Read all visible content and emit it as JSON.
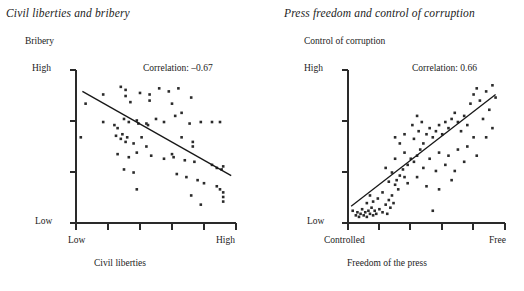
{
  "figure": {
    "background_color": "#ffffff",
    "point_color": "#2b2b2b",
    "line_color": "#171717"
  },
  "panels": [
    {
      "title": "Civil liberties and bribery",
      "y_axis_title": "Bribery",
      "x_axis_title": "Civil liberties",
      "y_tick_high": "High",
      "y_tick_low": "Low",
      "x_tick_left": "Low",
      "x_tick_right": "High",
      "correlation_label": "Correlation: –0.67"
    },
    {
      "title": "Press freedom and control of corruption",
      "y_axis_title": "Control of corruption",
      "x_axis_title": "Freedom of the press",
      "y_tick_high": "High",
      "y_tick_low": "Low",
      "x_tick_left": "Controlled",
      "x_tick_right": "Free",
      "correlation_label": "Correlation: 0.66"
    }
  ],
  "chart_data": [
    {
      "type": "scatter",
      "title": "Civil liberties and bribery",
      "xlabel": "Civil liberties",
      "ylabel": "Bribery",
      "xlim": [
        0,
        1
      ],
      "ylim": [
        0,
        1
      ],
      "xtick_labels": [
        "Low",
        "High"
      ],
      "ytick_labels": [
        "Low",
        "High"
      ],
      "grid": false,
      "legend": "none",
      "annotations": [
        "Correlation: –0.67"
      ],
      "correlation": -0.67,
      "trendline": {
        "x": [
          0.04,
          0.97
        ],
        "y": [
          0.86,
          0.31
        ]
      },
      "points": [
        [
          0.06,
          0.78
        ],
        [
          0.03,
          0.56
        ],
        [
          0.17,
          0.84
        ],
        [
          0.28,
          0.89
        ],
        [
          0.31,
          0.87
        ],
        [
          0.31,
          0.83
        ],
        [
          0.34,
          0.79
        ],
        [
          0.3,
          0.68
        ],
        [
          0.4,
          0.85
        ],
        [
          0.46,
          0.8
        ],
        [
          0.46,
          0.84
        ],
        [
          0.52,
          0.88
        ],
        [
          0.58,
          0.86
        ],
        [
          0.6,
          0.78
        ],
        [
          0.64,
          0.88
        ],
        [
          0.66,
          0.72
        ],
        [
          0.72,
          0.82
        ],
        [
          0.17,
          0.66
        ],
        [
          0.24,
          0.64
        ],
        [
          0.26,
          0.62
        ],
        [
          0.33,
          0.66
        ],
        [
          0.38,
          0.67
        ],
        [
          0.39,
          0.65
        ],
        [
          0.44,
          0.65
        ],
        [
          0.45,
          0.64
        ],
        [
          0.5,
          0.68
        ],
        [
          0.55,
          0.66
        ],
        [
          0.62,
          0.7
        ],
        [
          0.71,
          0.65
        ],
        [
          0.78,
          0.66
        ],
        [
          0.85,
          0.66
        ],
        [
          0.9,
          0.66
        ],
        [
          0.25,
          0.57
        ],
        [
          0.28,
          0.55
        ],
        [
          0.29,
          0.58
        ],
        [
          0.32,
          0.56
        ],
        [
          0.31,
          0.53
        ],
        [
          0.36,
          0.52
        ],
        [
          0.41,
          0.56
        ],
        [
          0.44,
          0.5
        ],
        [
          0.66,
          0.56
        ],
        [
          0.73,
          0.53
        ],
        [
          0.73,
          0.5
        ],
        [
          0.26,
          0.45
        ],
        [
          0.33,
          0.43
        ],
        [
          0.38,
          0.46
        ],
        [
          0.47,
          0.44
        ],
        [
          0.55,
          0.42
        ],
        [
          0.6,
          0.45
        ],
        [
          0.61,
          0.43
        ],
        [
          0.68,
          0.41
        ],
        [
          0.74,
          0.4
        ],
        [
          0.85,
          0.38
        ],
        [
          0.88,
          0.36
        ],
        [
          0.91,
          0.35
        ],
        [
          0.92,
          0.37
        ],
        [
          0.3,
          0.35
        ],
        [
          0.36,
          0.33
        ],
        [
          0.63,
          0.32
        ],
        [
          0.69,
          0.3
        ],
        [
          0.76,
          0.28
        ],
        [
          0.8,
          0.26
        ],
        [
          0.88,
          0.24
        ],
        [
          0.9,
          0.22
        ],
        [
          0.92,
          0.2
        ],
        [
          0.92,
          0.17
        ],
        [
          0.92,
          0.14
        ],
        [
          0.38,
          0.22
        ],
        [
          0.72,
          0.18
        ],
        [
          0.78,
          0.12
        ]
      ]
    },
    {
      "type": "scatter",
      "title": "Press freedom and control of corruption",
      "xlabel": "Freedom of the press",
      "ylabel": "Control of corruption",
      "xlim": [
        0,
        1
      ],
      "ylim": [
        0,
        1
      ],
      "xtick_labels": [
        "Controlled",
        "Free"
      ],
      "ytick_labels": [
        "Low",
        "High"
      ],
      "grid": false,
      "legend": "none",
      "annotations": [
        "Correlation: 0.66"
      ],
      "correlation": 0.66,
      "trendline": {
        "x": [
          0.02,
          0.94
        ],
        "y": [
          0.11,
          0.84
        ]
      },
      "points": [
        [
          0.03,
          0.08
        ],
        [
          0.05,
          0.05
        ],
        [
          0.06,
          0.07
        ],
        [
          0.07,
          0.04
        ],
        [
          0.08,
          0.06
        ],
        [
          0.09,
          0.09
        ],
        [
          0.1,
          0.05
        ],
        [
          0.11,
          0.07
        ],
        [
          0.12,
          0.04
        ],
        [
          0.13,
          0.08
        ],
        [
          0.14,
          0.06
        ],
        [
          0.15,
          0.1
        ],
        [
          0.16,
          0.05
        ],
        [
          0.17,
          0.08
        ],
        [
          0.18,
          0.06
        ],
        [
          0.2,
          0.09
        ],
        [
          0.22,
          0.07
        ],
        [
          0.24,
          0.12
        ],
        [
          0.25,
          0.06
        ],
        [
          0.26,
          0.15
        ],
        [
          0.27,
          0.1
        ],
        [
          0.28,
          0.18
        ],
        [
          0.29,
          0.13
        ],
        [
          0.22,
          0.2
        ],
        [
          0.19,
          0.16
        ],
        [
          0.16,
          0.14
        ],
        [
          0.14,
          0.18
        ],
        [
          0.12,
          0.13
        ],
        [
          0.3,
          0.25
        ],
        [
          0.31,
          0.28
        ],
        [
          0.33,
          0.31
        ],
        [
          0.28,
          0.33
        ],
        [
          0.26,
          0.27
        ],
        [
          0.32,
          0.22
        ],
        [
          0.35,
          0.35
        ],
        [
          0.36,
          0.3
        ],
        [
          0.38,
          0.38
        ],
        [
          0.4,
          0.42
        ],
        [
          0.42,
          0.4
        ],
        [
          0.44,
          0.44
        ],
        [
          0.46,
          0.48
        ],
        [
          0.33,
          0.52
        ],
        [
          0.3,
          0.56
        ],
        [
          0.36,
          0.58
        ],
        [
          0.42,
          0.55
        ],
        [
          0.45,
          0.6
        ],
        [
          0.48,
          0.52
        ],
        [
          0.5,
          0.58
        ],
        [
          0.52,
          0.62
        ],
        [
          0.47,
          0.66
        ],
        [
          0.44,
          0.7
        ],
        [
          0.41,
          0.64
        ],
        [
          0.54,
          0.56
        ],
        [
          0.56,
          0.6
        ],
        [
          0.58,
          0.64
        ],
        [
          0.6,
          0.58
        ],
        [
          0.62,
          0.66
        ],
        [
          0.64,
          0.62
        ],
        [
          0.66,
          0.68
        ],
        [
          0.68,
          0.72
        ],
        [
          0.7,
          0.66
        ],
        [
          0.72,
          0.6
        ],
        [
          0.74,
          0.7
        ],
        [
          0.76,
          0.64
        ],
        [
          0.78,
          0.78
        ],
        [
          0.8,
          0.84
        ],
        [
          0.82,
          0.88
        ],
        [
          0.84,
          0.8
        ],
        [
          0.88,
          0.86
        ],
        [
          0.92,
          0.9
        ],
        [
          0.94,
          0.82
        ],
        [
          0.9,
          0.74
        ],
        [
          0.86,
          0.68
        ],
        [
          0.8,
          0.56
        ],
        [
          0.76,
          0.5
        ],
        [
          0.7,
          0.48
        ],
        [
          0.64,
          0.44
        ],
        [
          0.58,
          0.46
        ],
        [
          0.52,
          0.42
        ],
        [
          0.48,
          0.36
        ],
        [
          0.56,
          0.34
        ],
        [
          0.62,
          0.38
        ],
        [
          0.68,
          0.34
        ],
        [
          0.74,
          0.4
        ],
        [
          0.82,
          0.44
        ],
        [
          0.88,
          0.56
        ],
        [
          0.92,
          0.62
        ],
        [
          0.44,
          0.3
        ],
        [
          0.38,
          0.26
        ],
        [
          0.5,
          0.24
        ],
        [
          0.58,
          0.22
        ],
        [
          0.66,
          0.28
        ],
        [
          0.54,
          0.08
        ],
        [
          0.36,
          0.46
        ],
        [
          0.3,
          0.42
        ],
        [
          0.24,
          0.36
        ]
      ]
    }
  ]
}
